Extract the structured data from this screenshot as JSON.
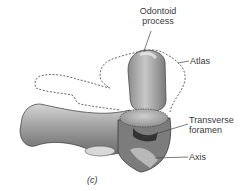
{
  "figure": {
    "caption": "(c)",
    "labels": {
      "odontoid_line1": "Odontoid",
      "odontoid_line2": "process",
      "atlas": "Atlas",
      "transverse_line1": "Transverse",
      "transverse_line2": "foramen",
      "axis": "Axis"
    },
    "colors": {
      "bone_light": "#d9d9d9",
      "bone_mid": "#a8a8a8",
      "bone_dark": "#5a5a5a",
      "outline_dashed": "#555555",
      "label_text": "#3a3a3a",
      "leader_line": "#444444"
    }
  }
}
